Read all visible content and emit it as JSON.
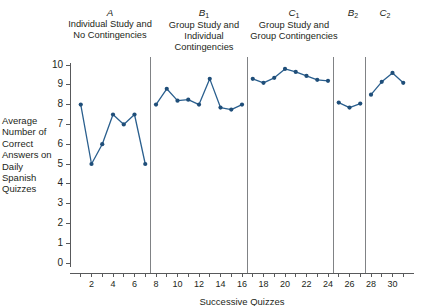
{
  "chart_data": {
    "type": "line",
    "title": "",
    "xlabel": "Successive Quizzes",
    "ylabel": "Average Number of Correct Answers on Daily Spanish Quizzes",
    "xlim": [
      0,
      32
    ],
    "ylim": [
      0,
      10
    ],
    "grid": false,
    "legend": "none",
    "y_ticks": [
      0,
      1,
      2,
      3,
      4,
      5,
      6,
      7,
      8,
      9,
      10
    ],
    "y_tick_labels": [
      "0",
      "1",
      "2",
      "3",
      "4",
      "5",
      "6",
      "7",
      "8",
      "9",
      "10"
    ],
    "x_ticks": [
      1,
      2,
      3,
      4,
      5,
      6,
      7,
      8,
      9,
      10,
      11,
      12,
      13,
      14,
      15,
      16,
      17,
      18,
      19,
      20,
      21,
      22,
      23,
      24,
      25,
      26,
      27,
      28,
      29,
      30,
      31
    ],
    "x_tick_labels": [
      {
        "x": 2,
        "label": "2"
      },
      {
        "x": 4,
        "label": "4"
      },
      {
        "x": 6,
        "label": "6"
      },
      {
        "x": 8,
        "label": "8"
      },
      {
        "x": 10,
        "label": "10"
      },
      {
        "x": 12,
        "label": "12"
      },
      {
        "x": 14,
        "label": "14"
      },
      {
        "x": 16,
        "label": "16"
      },
      {
        "x": 18,
        "label": "18"
      },
      {
        "x": 20,
        "label": "20"
      },
      {
        "x": 22,
        "label": "22"
      },
      {
        "x": 24,
        "label": "24"
      },
      {
        "x": 26,
        "label": "26"
      },
      {
        "x": 28,
        "label": "28"
      },
      {
        "x": 30,
        "label": "30"
      }
    ],
    "phase_dividers": [
      7.5,
      16.5,
      24.5,
      27.5
    ],
    "series": [
      {
        "name": "Average correct answers",
        "color": "#2a5f8e",
        "x": [
          1,
          2,
          3,
          4,
          5,
          6,
          7,
          8,
          9,
          10,
          11,
          12,
          13,
          14,
          15,
          16,
          17,
          18,
          19,
          20,
          21,
          22,
          23,
          24,
          25,
          26,
          27,
          28,
          29,
          30,
          31
        ],
        "values": [
          8,
          5,
          6,
          7.5,
          7,
          7.5,
          5,
          8,
          8.8,
          8.2,
          8.25,
          8,
          9.3,
          7.85,
          7.75,
          8,
          9.3,
          9.1,
          9.35,
          9.8,
          9.65,
          9.45,
          9.25,
          9.2,
          8.1,
          7.85,
          8.05,
          8.5,
          9.15,
          9.6,
          9.1
        ]
      }
    ],
    "phases": [
      {
        "id": "A",
        "letter": "A",
        "subscript": "",
        "description": "Individual Study and No Contingencies",
        "x_start": 1,
        "x_end": 7,
        "values": [
          8,
          5,
          6,
          7.5,
          7,
          7.5,
          5
        ]
      },
      {
        "id": "B1",
        "letter": "B",
        "subscript": "1",
        "description": "Group Study and Individual Contingencies",
        "x_start": 8,
        "x_end": 16,
        "values": [
          8,
          8.8,
          8.2,
          8.25,
          8,
          9.3,
          7.85,
          7.75,
          8
        ]
      },
      {
        "id": "C1",
        "letter": "C",
        "subscript": "1",
        "description": "Group Study and Group Contingencies",
        "x_start": 17,
        "x_end": 24,
        "values": [
          9.3,
          9.1,
          9.35,
          9.8,
          9.65,
          9.45,
          9.25,
          9.2
        ]
      },
      {
        "id": "B2",
        "letter": "B",
        "subscript": "2",
        "description": "",
        "x_start": 25,
        "x_end": 27,
        "values": [
          8.1,
          7.85,
          8.05
        ]
      },
      {
        "id": "C2",
        "letter": "C",
        "subscript": "2",
        "description": "",
        "x_start": 28,
        "x_end": 31,
        "values": [
          8.5,
          9.15,
          9.6,
          9.1
        ]
      }
    ]
  },
  "figure": {
    "ylabel_text": "Average Number of Correct Answers on Daily Spanish Quizzes",
    "xlabel_text": "Successive Quizzes",
    "phase_labels": [
      {
        "letter": "A",
        "sub": "",
        "desc": "Individual Study and No Contingencies"
      },
      {
        "letter": "B",
        "sub": "1",
        "desc": "Group Study and Individual Contingencies"
      },
      {
        "letter": "C",
        "sub": "1",
        "desc": "Group Study and Group Contingencies"
      },
      {
        "letter": "B",
        "sub": "2",
        "desc": ""
      },
      {
        "letter": "C",
        "sub": "2",
        "desc": ""
      }
    ]
  }
}
